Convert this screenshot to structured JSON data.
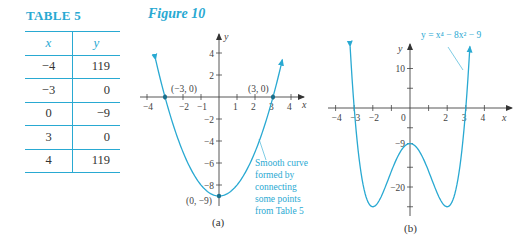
{
  "table": {
    "title": "TABLE 5",
    "headers": [
      "x",
      "y"
    ],
    "rows": [
      [
        "−4",
        "119"
      ],
      [
        "−3",
        "0"
      ],
      [
        "0",
        "−9"
      ],
      [
        "3",
        "0"
      ],
      [
        "4",
        "119"
      ]
    ]
  },
  "figure": {
    "title": "Figure 10"
  },
  "colors": {
    "accent": "#29a9d2",
    "axis": "#444444",
    "text": "#333333"
  },
  "chart_data": [
    {
      "type": "line",
      "subtitle": "(a)",
      "function": "y = x^2 - 9",
      "xlabel": "x",
      "ylabel": "y",
      "xlim": [
        -4,
        4
      ],
      "ylim": [
        -9,
        4
      ],
      "x_ticks": [
        -4,
        -3,
        -2,
        -1,
        1,
        2,
        3,
        4
      ],
      "x_tick_labels": [
        "−4",
        "",
        "−2",
        "−1",
        "1",
        "2",
        "3",
        "4"
      ],
      "y_ticks": [
        4,
        2,
        -2,
        -4,
        -6,
        -8
      ],
      "y_tick_labels": [
        "4",
        "2",
        "−2",
        "−4",
        "−6",
        "−8"
      ],
      "points": [
        {
          "x": -3,
          "y": 0,
          "label": "(−3, 0)"
        },
        {
          "x": 3,
          "y": 0,
          "label": "(3, 0)"
        },
        {
          "x": 0,
          "y": -9,
          "label": "(0, −9)"
        }
      ],
      "annotation": [
        "Smooth curve",
        "formed by",
        "connecting",
        "some points",
        "from Table 5"
      ],
      "grid": false,
      "x_range_drawn": [
        -3.52,
        3.52
      ]
    },
    {
      "type": "line",
      "subtitle": "(b)",
      "function": "y = x^4 - 8x^2 - 9",
      "equation_label": "y = x⁴ − 8x² − 9",
      "xlabel": "x",
      "ylabel": "y",
      "xlim": [
        -4,
        4
      ],
      "ylim": [
        -25,
        15
      ],
      "x_ticks": [
        -4,
        -3,
        -2,
        -1,
        1,
        2,
        3,
        4
      ],
      "x_tick_labels": [
        "−4",
        "−3",
        "−2",
        "",
        "",
        "2",
        "3",
        "4"
      ],
      "origin_label": "0",
      "y_ticks": [
        10,
        5,
        -5,
        -9,
        -15,
        -20,
        -25
      ],
      "y_tick_labels": [
        "10",
        "",
        "",
        "−9",
        "",
        "−20",
        ""
      ],
      "minima": [
        {
          "x": -2,
          "y": -25
        },
        {
          "x": 2,
          "y": -25
        }
      ],
      "local_max": {
        "x": 0,
        "y": -9
      },
      "grid": false,
      "x_range_drawn": [
        -3.22,
        3.22
      ]
    }
  ]
}
